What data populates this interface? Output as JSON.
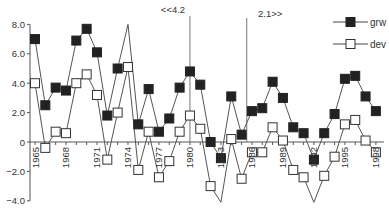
{
  "chart_data": {
    "type": "line",
    "title": "",
    "xlabel": "",
    "ylabel": "",
    "ylim": [
      -4.0,
      8.0
    ],
    "xlim": [
      1965,
      1998
    ],
    "grid": false,
    "legend_position": "top-right",
    "y_ticks": [
      8.0,
      6.0,
      4.0,
      2.0,
      0,
      -2.0,
      -4.0
    ],
    "y_tick_labels": [
      "8.0",
      "6.0",
      "4.0",
      "2.0",
      "0",
      "−2.0",
      "−4.0"
    ],
    "x_tick_labels": [
      "1965",
      "1968",
      "1971",
      "1974",
      "1977",
      "1980",
      "1983",
      "1986",
      "1989",
      "1992",
      "1995",
      "1998"
    ],
    "x": [
      1965,
      1966,
      1967,
      1968,
      1969,
      1970,
      1971,
      1972,
      1973,
      1974,
      1975,
      1976,
      1977,
      1978,
      1979,
      1980,
      1981,
      1982,
      1983,
      1984,
      1985,
      1986,
      1987,
      1988,
      1989,
      1990,
      1991,
      1992,
      1993,
      1994,
      1995,
      1996,
      1997,
      1998
    ],
    "series": [
      {
        "name": "grw",
        "marker": "filled-square",
        "color": "#222222",
        "values": [
          7.0,
          2.5,
          3.7,
          3.5,
          6.9,
          7.7,
          6.1,
          1.8,
          5.0,
          8.0,
          1.2,
          3.6,
          0.7,
          1.6,
          3.7,
          4.8,
          3.9,
          0.0,
          -1.1,
          3.1,
          0.5,
          2.1,
          2.3,
          4.1,
          3.0,
          1.0,
          0.6,
          -1.2,
          0.6,
          1.9,
          4.3,
          4.5,
          3.1,
          2.1
        ],
        "hidden_markers": [
          1974
        ]
      },
      {
        "name": "dev",
        "marker": "open-square",
        "color": "#222222",
        "values": [
          4.0,
          -0.4,
          0.7,
          0.6,
          4.0,
          4.6,
          3.2,
          -1.2,
          2.0,
          5.1,
          -1.9,
          0.7,
          -2.4,
          -1.3,
          0.7,
          1.8,
          0.9,
          -3.0,
          -4.1,
          0.2,
          -2.5,
          -0.7,
          -0.7,
          1.0,
          0.1,
          -1.9,
          -2.4,
          -4.1,
          -2.3,
          -1.0,
          1.2,
          1.5,
          0.1,
          -0.7
        ],
        "hidden_markers": [
          1983,
          1992
        ]
      }
    ],
    "annotations": [
      {
        "text": "<<4.2",
        "x": 1980,
        "type": "vertical-line"
      },
      {
        "text": "2.1>>",
        "x": 1985.5,
        "type": "vertical-line"
      }
    ]
  }
}
